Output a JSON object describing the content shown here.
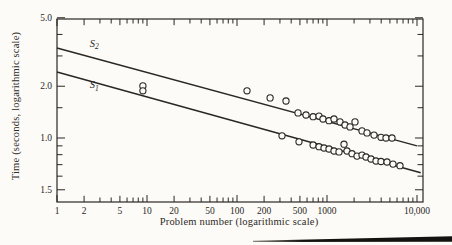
{
  "figure": {
    "x_axis_title": "Problem number (logarithmic scale)",
    "y_axis_title": "Time (seconds, logarithmic scale)",
    "ink_color": "#2b2723",
    "paper_color": "#fcfbf8"
  },
  "chart_data": {
    "type": "scatter",
    "title": "",
    "xlabel": "Problem number (logarithmic scale)",
    "ylabel": "Time (seconds, logarithmic scale)",
    "x_scale": "log",
    "y_scale": "log",
    "xlim": [
      1,
      11600
    ],
    "ylim": [
      0.42,
      5.0
    ],
    "grid": false,
    "x_ticks_labeled": [
      {
        "v": 1,
        "label": "1"
      },
      {
        "v": 2,
        "label": "2"
      },
      {
        "v": 5,
        "label": "5"
      },
      {
        "v": 10,
        "label": "10"
      },
      {
        "v": 20,
        "label": "20"
      },
      {
        "v": 50,
        "label": "50"
      },
      {
        "v": 100,
        "label": "100"
      },
      {
        "v": 200,
        "label": "200"
      },
      {
        "v": 500,
        "label": "500"
      },
      {
        "v": 1000,
        "label": "1000"
      },
      {
        "v": 10000,
        "label": "10,000"
      }
    ],
    "x_ticks_minor": [
      3,
      4,
      6,
      7,
      8,
      9,
      30,
      40,
      60,
      70,
      80,
      90,
      300,
      400,
      600,
      700,
      800,
      900,
      2000,
      3000,
      4000,
      5000,
      6000,
      7000,
      8000,
      9000
    ],
    "y_ticks_labeled": [
      {
        "v": 5.0,
        "label": "5.0"
      },
      {
        "v": 2.0,
        "label": "2.0"
      },
      {
        "v": 1.0,
        "label": "1.0"
      },
      {
        "v": 0.5,
        "label": "1.5"
      }
    ],
    "y_ticks_minor": [
      4,
      3,
      1.5,
      0.9,
      0.8,
      0.7,
      0.6
    ],
    "series": [
      {
        "name": "S2",
        "label_base": "S",
        "label_sub": "2",
        "label_at": [
          2.6,
          3.4
        ],
        "line": [
          [
            1,
            3.34
          ],
          [
            10000,
            0.9
          ]
        ],
        "points": [
          [
            129,
            1.88
          ],
          [
            233,
            1.71
          ],
          [
            350,
            1.64
          ],
          [
            476,
            1.4
          ],
          [
            585,
            1.36
          ],
          [
            700,
            1.33
          ],
          [
            815,
            1.34
          ],
          [
            903,
            1.29
          ],
          [
            1053,
            1.26
          ],
          [
            1197,
            1.29
          ],
          [
            1394,
            1.24
          ],
          [
            1585,
            1.19
          ],
          [
            1802,
            1.16
          ],
          [
            2047,
            1.24
          ],
          [
            2448,
            1.1
          ],
          [
            2780,
            1.07
          ],
          [
            3325,
            1.04
          ],
          [
            3981,
            1.01
          ],
          [
            4527,
            1.0
          ],
          [
            5272,
            1.0
          ]
        ]
      },
      {
        "name": "S1",
        "label_base": "S",
        "label_sub": "1",
        "label_at": [
          2.6,
          1.95
        ],
        "line": [
          [
            1,
            2.42
          ],
          [
            11000,
            0.628
          ]
        ],
        "points": [
          [
            9.0,
            2.01
          ],
          [
            9.0,
            1.88
          ],
          [
            316,
            1.03
          ],
          [
            489,
            0.95
          ],
          [
            700,
            0.91
          ],
          [
            815,
            0.89
          ],
          [
            927,
            0.875
          ],
          [
            1053,
            0.863
          ],
          [
            1197,
            0.84
          ],
          [
            1361,
            0.83
          ],
          [
            1545,
            0.92
          ],
          [
            1668,
            0.84
          ],
          [
            1896,
            0.81
          ],
          [
            2154,
            0.785
          ],
          [
            2448,
            0.795
          ],
          [
            2712,
            0.775
          ],
          [
            3083,
            0.755
          ],
          [
            3499,
            0.735
          ],
          [
            3981,
            0.73
          ],
          [
            4642,
            0.725
          ],
          [
            5408,
            0.705
          ],
          [
            6471,
            0.69
          ]
        ]
      }
    ],
    "layout": {
      "plot_box_px": {
        "left": 57,
        "top": 19,
        "right": 423,
        "bottom": 202
      },
      "px_per_decade_x": 90,
      "px_per_decade_y": 172,
      "x1_px": 57,
      "y1_px": 138
    }
  },
  "decoration": {
    "page_rule_color": "#141210"
  }
}
